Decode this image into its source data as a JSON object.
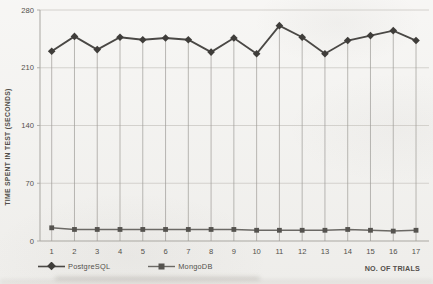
{
  "chart_data": {
    "type": "line",
    "title": "",
    "xlabel": "NO. OF TRIALS",
    "ylabel": "TIME SPENT IN TEST (SECONDS)",
    "categories": [
      "1",
      "2",
      "3",
      "4",
      "5",
      "6",
      "7",
      "8",
      "9",
      "10",
      "11",
      "12",
      "13",
      "14",
      "15",
      "16",
      "17"
    ],
    "ylim": [
      0,
      280
    ],
    "yticks": [
      0,
      70,
      140,
      210,
      280
    ],
    "grid": true,
    "drop_lines": true,
    "legend_position": "bottom-left",
    "series": [
      {
        "name": "PostgreSQL",
        "marker": "diamond",
        "color": "#4a4845",
        "values": [
          230,
          248,
          232,
          247,
          244,
          246,
          244,
          229,
          246,
          227,
          261,
          247,
          227,
          243,
          249,
          255,
          243
        ]
      },
      {
        "name": "MongoDB",
        "marker": "square",
        "color": "#6b6965",
        "values": [
          16,
          14,
          14,
          14,
          14,
          14,
          14,
          14,
          14,
          13,
          13,
          13,
          13,
          14,
          13,
          12,
          13
        ]
      }
    ]
  },
  "colors": {
    "background": "#f3f2ef",
    "grid": "#cfcdc8",
    "axis": "#a9a7a2",
    "drop_line": "#9d9b96",
    "text": "#53504b",
    "postgresql": "#4a4845",
    "mongodb": "#6b6965"
  }
}
